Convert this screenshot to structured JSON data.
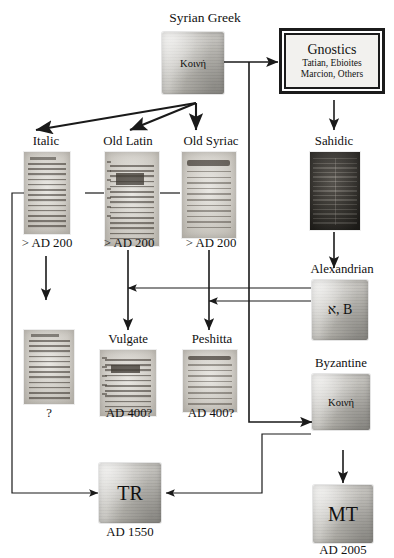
{
  "diagram": {
    "title_clipped": "",
    "nodes": {
      "syrian_greek": {
        "label": "Syrian Greek",
        "content": "Κοινή",
        "date": ""
      },
      "gnostics": {
        "label": "Gnostics",
        "line1": "Tatian, Ebioites",
        "line2": "Marcion, Others"
      },
      "italic": {
        "label": "Italic",
        "date": "> AD 200"
      },
      "old_latin": {
        "label": "Old Latin",
        "date": "> AD 200"
      },
      "old_syriac": {
        "label": "Old Syriac",
        "date": "> AD 200"
      },
      "sahidic": {
        "label": "Sahidic",
        "date": ""
      },
      "alexandrian": {
        "label": "Alexandrian",
        "content": "א, B",
        "date": ""
      },
      "unknown_italic_desc": {
        "label": "",
        "date": "?"
      },
      "vulgate": {
        "label": "Vulgate",
        "date": "AD 400?"
      },
      "peshitta": {
        "label": "Peshitta",
        "date": "AD 400?"
      },
      "byzantine": {
        "label": "Byzantine",
        "content": "Κοινή",
        "date": ""
      },
      "tr": {
        "label": "TR",
        "date": "AD 1550"
      },
      "mt": {
        "label": "MT",
        "date": "AD 2005"
      }
    },
    "colors": {
      "ink": "#1a1a1a",
      "parchment": "#c8c6c0",
      "manuscript_light": "#e3e1db",
      "manuscript_dark": "#3a372f",
      "box_border": "#1b1b1b",
      "page_background": "#ffffff"
    },
    "edges": [
      {
        "from": "syrian_greek",
        "to": "gnostics",
        "kind": "arrow"
      },
      {
        "from": "syrian_greek",
        "to": "italic",
        "kind": "arrow"
      },
      {
        "from": "syrian_greek",
        "to": "old_latin",
        "kind": "arrow"
      },
      {
        "from": "syrian_greek",
        "to": "old_syriac",
        "kind": "arrow"
      },
      {
        "from": "syrian_greek",
        "to": "byzantine",
        "kind": "arrow"
      },
      {
        "from": "gnostics",
        "to": "sahidic",
        "kind": "arrow"
      },
      {
        "from": "italic",
        "to": "old_latin",
        "kind": "line"
      },
      {
        "from": "old_latin",
        "to": "old_syriac",
        "kind": "line"
      },
      {
        "from": "italic",
        "to": "unknown_italic_desc",
        "kind": "arrow"
      },
      {
        "from": "italic",
        "to": "tr",
        "kind": "arrow"
      },
      {
        "from": "old_latin",
        "to": "vulgate",
        "kind": "arrow"
      },
      {
        "from": "old_syriac",
        "to": "peshitta",
        "kind": "arrow"
      },
      {
        "from": "sahidic",
        "to": "alexandrian",
        "kind": "arrow"
      },
      {
        "from": "alexandrian",
        "to": "vulgate",
        "kind": "arrow"
      },
      {
        "from": "alexandrian",
        "to": "peshitta",
        "kind": "arrow"
      },
      {
        "from": "byzantine",
        "to": "tr",
        "kind": "arrow"
      },
      {
        "from": "byzantine",
        "to": "mt",
        "kind": "arrow"
      }
    ]
  }
}
